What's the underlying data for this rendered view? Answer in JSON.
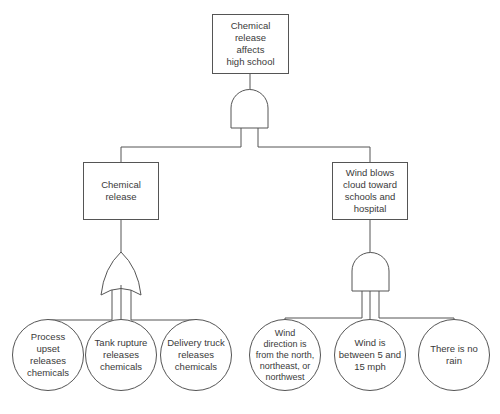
{
  "diagram": {
    "type": "fault-tree",
    "top_event": {
      "label": "Chemical\nrelease\naffects\nhigh school"
    },
    "top_gate": {
      "type": "AND"
    },
    "intermediate_events": [
      {
        "label": "Chemical\nrelease",
        "gate": "OR"
      },
      {
        "label": "Wind blows\ncloud toward\nschools and\nhospital",
        "gate": "AND"
      }
    ],
    "basic_events": [
      {
        "label": "Process\nupset\nreleases\nchemicals",
        "parent": "Chemical release"
      },
      {
        "label": "Tank rupture\nreleases\nchemicals",
        "parent": "Chemical release"
      },
      {
        "label": "Delivery truck\nreleases\nchemicals",
        "parent": "Chemical release"
      },
      {
        "label": "Wind\ndirection is\nfrom the north,\nnortheast, or\nnorthwest",
        "parent": "Wind blows cloud toward schools and hospital"
      },
      {
        "label": "Wind is\nbetween 5 and\n15 mph",
        "parent": "Wind blows cloud toward schools and hospital"
      },
      {
        "label": "There is no\nrain",
        "parent": "Wind blows cloud toward schools and hospital"
      }
    ],
    "colors": {
      "stroke": "#555555",
      "text": "#3a3a3a",
      "background": "#ffffff"
    }
  }
}
